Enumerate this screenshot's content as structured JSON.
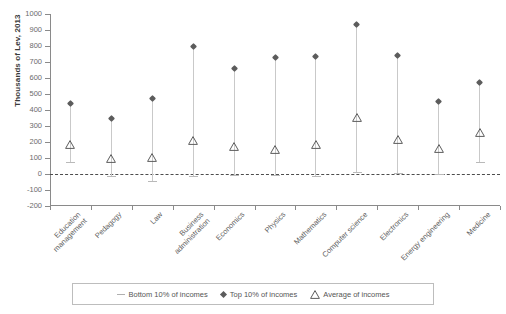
{
  "chart_data": {
    "type": "scatter",
    "title": "",
    "subtitle": "",
    "xlabel": "",
    "ylabel": "Thousands of Lev, 2013",
    "ylim": [
      -200,
      1000
    ],
    "yticks": [
      1000,
      900,
      800,
      700,
      600,
      500,
      400,
      300,
      200,
      100,
      0,
      -100,
      -200
    ],
    "ytick_labels": [
      "1000",
      "900",
      "800",
      "700",
      "600",
      "500",
      "400",
      "300",
      "200",
      "100",
      "0",
      "-100",
      "-200"
    ],
    "grid": false,
    "zero_reference_line": 0,
    "legend_position": "bottom",
    "categories": [
      "Education management",
      "Pedagogy",
      "Law",
      "Business administration",
      "Economics",
      "Physics",
      "Mathematics",
      "Computer science",
      "Electronics",
      "Energy engineering",
      "Medicine"
    ],
    "series": [
      {
        "name": "Bottom 10% of incomes",
        "marker": "dash",
        "color": "#b0b0b0",
        "values": [
          75,
          -10,
          -45,
          -10,
          -5,
          -5,
          -15,
          10,
          5,
          0,
          75
        ]
      },
      {
        "name": "Top 10% of incomes",
        "marker": "diamond",
        "color": "#5c5c5c",
        "values": [
          440,
          350,
          470,
          800,
          660,
          730,
          735,
          935,
          740,
          455,
          575
        ]
      },
      {
        "name": "Average of incomes",
        "marker": "triangle",
        "color": "#5c5c5c",
        "values": [
          215,
          128,
          135,
          243,
          203,
          185,
          213,
          385,
          247,
          193,
          293
        ]
      }
    ]
  },
  "legend": {
    "items": [
      {
        "label": "Bottom 10% of incomes",
        "icon": "dash-marker"
      },
      {
        "label": "Top 10% of incomes",
        "icon": "diamond-marker"
      },
      {
        "label": "Average of incomes",
        "icon": "triangle-marker"
      }
    ]
  },
  "colors": {
    "axis": "#8a8a8a",
    "text": "#5e5e5e",
    "range_line": "#c9c9c9",
    "top_marker": "#5c5c5c",
    "zero_line": "#4d4d4d",
    "legend_border": "#bdbdbd"
  }
}
